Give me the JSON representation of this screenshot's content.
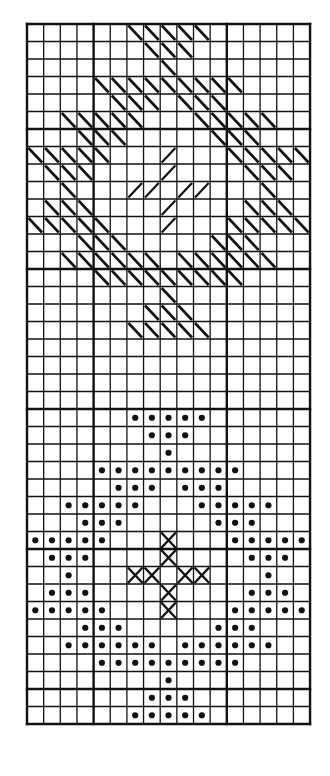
{
  "chart_title": "",
  "grid": {
    "cols": 17,
    "rows": 40,
    "cell_width": 16.65,
    "cell_height": 17.5,
    "heavy_rows": [
      6,
      14,
      22,
      30,
      38
    ],
    "heavy_cols": [
      4,
      12
    ],
    "line_color": "#111111",
    "paper_color": "#ffffff"
  },
  "legend": {
    "back_diagonal": "\\",
    "forward_diagonal": "/",
    "cross": "x",
    "dot": "o"
  },
  "motifs": [
    {
      "name": "diagonal-stitch-star",
      "row_range": [
        0,
        17
      ],
      "rows": [
        {
          "row": 0,
          "marks": [
            {
              "cols": [
                6,
                7,
                8,
                9,
                10
              ],
              "type": "\\"
            }
          ]
        },
        {
          "row": 1,
          "marks": [
            {
              "cols": [
                7,
                8,
                9
              ],
              "type": "\\"
            }
          ]
        },
        {
          "row": 2,
          "marks": [
            {
              "cols": [
                8
              ],
              "type": "\\"
            }
          ]
        },
        {
          "row": 3,
          "marks": [
            {
              "cols": [
                4,
                5,
                6,
                7,
                8,
                9,
                10,
                11,
                12
              ],
              "type": "\\"
            }
          ]
        },
        {
          "row": 4,
          "marks": [
            {
              "cols": [
                5,
                6,
                7,
                9,
                10,
                11
              ],
              "type": "\\"
            }
          ]
        },
        {
          "row": 5,
          "marks": [
            {
              "cols": [
                2,
                3,
                4,
                5,
                6,
                10,
                11,
                12,
                13,
                14
              ],
              "type": "\\"
            }
          ]
        },
        {
          "row": 6,
          "marks": [
            {
              "cols": [
                3,
                4,
                5,
                11,
                12,
                13
              ],
              "type": "\\"
            }
          ]
        },
        {
          "row": 7,
          "marks": [
            {
              "cols": [
                0,
                1,
                2,
                3,
                4,
                12,
                13,
                14,
                15,
                16
              ],
              "type": "\\"
            },
            {
              "cols": [
                8
              ],
              "type": "/"
            }
          ]
        },
        {
          "row": 8,
          "marks": [
            {
              "cols": [
                1,
                2,
                3,
                13,
                14,
                15
              ],
              "type": "\\"
            },
            {
              "cols": [
                8
              ],
              "type": "/"
            }
          ]
        },
        {
          "row": 9,
          "marks": [
            {
              "cols": [
                2,
                14
              ],
              "type": "\\"
            },
            {
              "cols": [
                6,
                7,
                9,
                10
              ],
              "type": "/"
            }
          ]
        },
        {
          "row": 10,
          "marks": [
            {
              "cols": [
                1,
                2,
                3,
                13,
                14,
                15
              ],
              "type": "\\"
            },
            {
              "cols": [
                8
              ],
              "type": "/"
            }
          ]
        },
        {
          "row": 11,
          "marks": [
            {
              "cols": [
                0,
                1,
                2,
                3,
                4,
                12,
                13,
                14,
                15,
                16
              ],
              "type": "\\"
            },
            {
              "cols": [
                8
              ],
              "type": "/"
            }
          ]
        },
        {
          "row": 12,
          "marks": [
            {
              "cols": [
                3,
                4,
                5,
                11,
                12,
                13
              ],
              "type": "\\"
            }
          ]
        },
        {
          "row": 13,
          "marks": [
            {
              "cols": [
                2,
                3,
                4,
                5,
                6,
                7,
                9,
                10,
                11,
                12,
                13,
                14
              ],
              "type": "\\"
            }
          ]
        },
        {
          "row": 14,
          "marks": [
            {
              "cols": [
                4,
                5,
                6,
                7,
                8,
                9,
                10,
                11,
                12
              ],
              "type": "\\"
            }
          ]
        },
        {
          "row": 15,
          "marks": [
            {
              "cols": [
                8
              ],
              "type": "\\"
            }
          ]
        },
        {
          "row": 16,
          "marks": [
            {
              "cols": [
                7,
                8,
                9
              ],
              "type": "\\"
            }
          ]
        },
        {
          "row": 17,
          "marks": [
            {
              "cols": [
                6,
                7,
                8,
                9,
                10
              ],
              "type": "\\"
            }
          ]
        }
      ]
    },
    {
      "name": "dot-and-cross-star",
      "row_range": [
        22,
        39
      ],
      "rows": [
        {
          "row": 22,
          "marks": [
            {
              "cols": [
                6,
                7,
                8,
                9,
                10
              ],
              "type": "o"
            }
          ]
        },
        {
          "row": 23,
          "marks": [
            {
              "cols": [
                7,
                8,
                9
              ],
              "type": "o"
            }
          ]
        },
        {
          "row": 24,
          "marks": [
            {
              "cols": [
                8
              ],
              "type": "o"
            }
          ]
        },
        {
          "row": 25,
          "marks": [
            {
              "cols": [
                4,
                5,
                6,
                7,
                8,
                9,
                10,
                11,
                12
              ],
              "type": "o"
            }
          ]
        },
        {
          "row": 26,
          "marks": [
            {
              "cols": [
                5,
                6,
                7,
                9,
                10,
                11
              ],
              "type": "o"
            }
          ]
        },
        {
          "row": 27,
          "marks": [
            {
              "cols": [
                2,
                3,
                4,
                5,
                6,
                10,
                11,
                12,
                13,
                14
              ],
              "type": "o"
            }
          ]
        },
        {
          "row": 28,
          "marks": [
            {
              "cols": [
                3,
                4,
                5,
                11,
                12,
                13
              ],
              "type": "o"
            }
          ]
        },
        {
          "row": 29,
          "marks": [
            {
              "cols": [
                0,
                1,
                2,
                3,
                4,
                12,
                13,
                14,
                15,
                16
              ],
              "type": "o"
            },
            {
              "cols": [
                8
              ],
              "type": "x"
            }
          ]
        },
        {
          "row": 30,
          "marks": [
            {
              "cols": [
                1,
                2,
                3,
                13,
                14,
                15
              ],
              "type": "o"
            },
            {
              "cols": [
                8
              ],
              "type": "x"
            }
          ]
        },
        {
          "row": 31,
          "marks": [
            {
              "cols": [
                2,
                14
              ],
              "type": "o"
            },
            {
              "cols": [
                6,
                7,
                9,
                10
              ],
              "type": "x"
            }
          ]
        },
        {
          "row": 32,
          "marks": [
            {
              "cols": [
                1,
                2,
                3,
                13,
                14,
                15
              ],
              "type": "o"
            },
            {
              "cols": [
                8
              ],
              "type": "x"
            }
          ]
        },
        {
          "row": 33,
          "marks": [
            {
              "cols": [
                0,
                1,
                2,
                3,
                4,
                12,
                13,
                14,
                15,
                16
              ],
              "type": "o"
            },
            {
              "cols": [
                8
              ],
              "type": "x"
            }
          ]
        },
        {
          "row": 34,
          "marks": [
            {
              "cols": [
                3,
                4,
                5,
                11,
                12,
                13
              ],
              "type": "o"
            }
          ]
        },
        {
          "row": 35,
          "marks": [
            {
              "cols": [
                2,
                3,
                4,
                5,
                6,
                7,
                9,
                10,
                11,
                12,
                13,
                14
              ],
              "type": "o"
            }
          ]
        },
        {
          "row": 36,
          "marks": [
            {
              "cols": [
                4,
                5,
                6,
                7,
                8,
                9,
                10,
                11,
                12
              ],
              "type": "o"
            }
          ]
        },
        {
          "row": 37,
          "marks": [
            {
              "cols": [
                8
              ],
              "type": "o"
            }
          ]
        },
        {
          "row": 38,
          "marks": [
            {
              "cols": [
                7,
                8,
                9
              ],
              "type": "o"
            }
          ]
        },
        {
          "row": 39,
          "marks": [
            {
              "cols": [
                6,
                7,
                8,
                9,
                10
              ],
              "type": "o"
            }
          ]
        }
      ]
    }
  ],
  "caption": ""
}
